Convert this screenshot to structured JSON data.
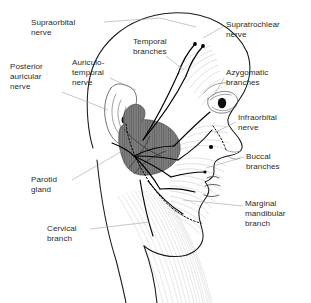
{
  "figure": {
    "background_color": "#ffffff",
    "label_color": "#2b2b2b",
    "leader_line_color": "#9a9a9a",
    "outline_color": "#1a1a1a",
    "parotid_fill_color": "#7d7d7d",
    "watermark": ""
  },
  "labels": [
    {
      "id": "supraorbital-nerve",
      "lines": [
        "Supraorbital",
        "nerve"
      ],
      "x": 31,
      "y": 18,
      "align": "left"
    },
    {
      "id": "posterior-auricular-nerve",
      "lines": [
        "Posterior",
        "auricular",
        "nerve"
      ],
      "x": 10,
      "y": 62,
      "align": "left"
    },
    {
      "id": "auriculotemporal-nerve",
      "lines": [
        "Auriculo-",
        "temporal",
        "nerve"
      ],
      "x": 72,
      "y": 58,
      "align": "left"
    },
    {
      "id": "temporal-branches",
      "lines": [
        "Temporal",
        "branches"
      ],
      "x": 133,
      "y": 37,
      "align": "left"
    },
    {
      "id": "supratrochlear-nerve",
      "lines": [
        "Supratrochlear",
        "nerve"
      ],
      "x": 226,
      "y": 20,
      "align": "left"
    },
    {
      "id": "azygomatic-branches",
      "lines": [
        "Azygomatic",
        "branches"
      ],
      "x": 226,
      "y": 68,
      "align": "left"
    },
    {
      "id": "infraorbital-nerve",
      "lines": [
        "Infraorbital",
        "nerve"
      ],
      "x": 238,
      "y": 113,
      "align": "left"
    },
    {
      "id": "buccal-branches",
      "lines": [
        "Buccal",
        "branches"
      ],
      "x": 246,
      "y": 152,
      "align": "left"
    },
    {
      "id": "marginal-mandibular-branch",
      "lines": [
        "Marginal",
        "mandibular",
        "branch"
      ],
      "x": 245,
      "y": 199,
      "align": "left"
    },
    {
      "id": "parotid-gland",
      "lines": [
        "Parotid",
        "gland"
      ],
      "x": 31,
      "y": 175,
      "align": "left"
    },
    {
      "id": "cervical-branch",
      "lines": [
        "Cervical",
        "branch"
      ],
      "x": 47,
      "y": 224,
      "align": "left"
    }
  ],
  "structures": [
    {
      "id": "parotid-gland-mass",
      "name": "Parotid gland",
      "shading": "vertical-hatch",
      "tone": "dark-gray"
    },
    {
      "id": "ear",
      "name": "Auricle (ear)"
    },
    {
      "id": "eye",
      "name": "Eye"
    },
    {
      "id": "nose",
      "name": "Nose profile"
    },
    {
      "id": "lips",
      "name": "Lips"
    },
    {
      "id": "neck",
      "name": "Neck and sternocleidomastoid striations"
    },
    {
      "id": "facial-nerve-trunk",
      "name": "Facial nerve trunk and branches"
    }
  ]
}
